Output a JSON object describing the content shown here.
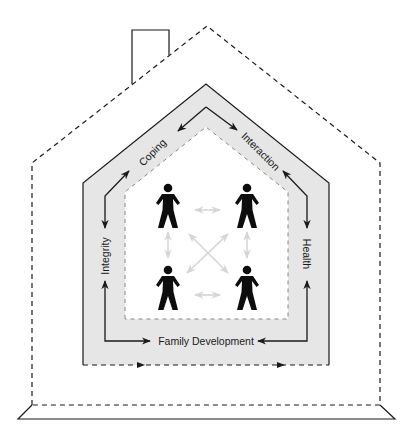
{
  "diagram": {
    "colors": {
      "line": "#1a1a1a",
      "band_fill": "#e6e6e6",
      "inner_arrow": "#d6d6d6",
      "figure": "#0d0d0d"
    },
    "labels": {
      "coping": "Coping",
      "interaction": "Interaction",
      "integrity": "Integrity",
      "health": "Health",
      "family_development": "Family Development"
    },
    "members": [
      {
        "id": "member-top-left"
      },
      {
        "id": "member-top-right"
      },
      {
        "id": "member-bottom-left"
      },
      {
        "id": "member-bottom-right"
      }
    ]
  }
}
